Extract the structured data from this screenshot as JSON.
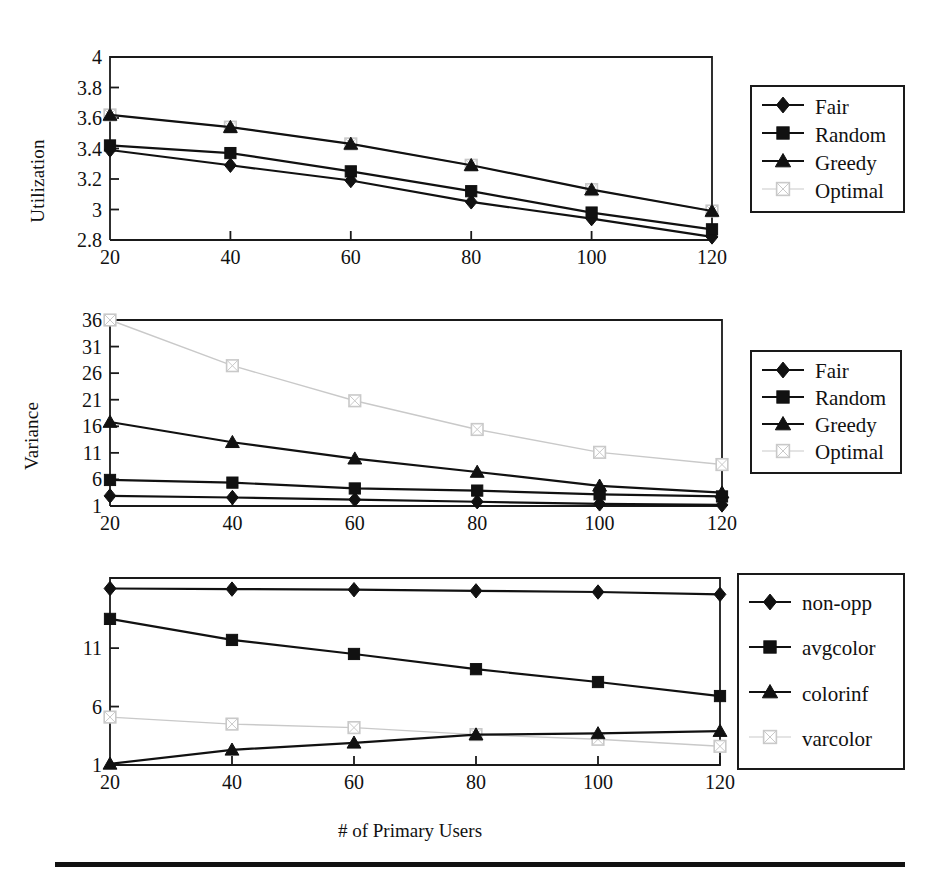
{
  "figure": {
    "xlabel": "# of Primary Users",
    "footer_rule": true
  },
  "chart_data": [
    {
      "id": "utilization",
      "type": "line",
      "title": "",
      "xlabel": "# of Primary Users",
      "ylabel": "Utilization",
      "x": [
        20,
        40,
        60,
        80,
        100,
        120
      ],
      "xticks": [
        "20",
        "40",
        "60",
        "80",
        "100",
        "120"
      ],
      "xlim": [
        20,
        120
      ],
      "ylim": [
        2.8,
        4
      ],
      "yticks": [
        "2.8",
        "3",
        "3.2",
        "3.4",
        "3.6",
        "3.8",
        "4"
      ],
      "ytickvals": [
        2.8,
        3,
        3.2,
        3.4,
        3.6,
        3.8,
        4
      ],
      "grid": false,
      "legend_position": "right-outside",
      "series": [
        {
          "name": "Fair",
          "marker": "diamond",
          "color": "#111111",
          "values": [
            3.39,
            3.29,
            3.19,
            3.05,
            2.94,
            2.82
          ]
        },
        {
          "name": "Random",
          "marker": "square",
          "color": "#111111",
          "values": [
            3.42,
            3.37,
            3.25,
            3.12,
            2.98,
            2.87
          ]
        },
        {
          "name": "Greedy",
          "marker": "triangle",
          "color": "#111111",
          "values": [
            3.62,
            3.54,
            3.43,
            3.29,
            3.13,
            2.99
          ]
        },
        {
          "name": "Optimal",
          "marker": "square-open",
          "color": "#c9c9c9",
          "values": [
            3.62,
            3.54,
            3.43,
            3.29,
            3.13,
            2.99
          ]
        }
      ]
    },
    {
      "id": "variance",
      "type": "line",
      "title": "",
      "xlabel": "# of Primary Users",
      "ylabel": "Variance",
      "x": [
        20,
        40,
        60,
        80,
        100,
        120
      ],
      "xticks": [
        "20",
        "40",
        "60",
        "80",
        "100",
        "120"
      ],
      "xlim": [
        20,
        120
      ],
      "ylim": [
        1,
        36
      ],
      "yticks": [
        "1",
        "6",
        "11",
        "16",
        "21",
        "26",
        "31",
        "36"
      ],
      "ytickvals": [
        1,
        6,
        11,
        16,
        21,
        26,
        31,
        36
      ],
      "grid": false,
      "legend_position": "right-outside",
      "series": [
        {
          "name": "Fair",
          "marker": "diamond",
          "color": "#111111",
          "values": [
            2.9,
            2.6,
            2.2,
            1.8,
            1.4,
            1.2
          ]
        },
        {
          "name": "Random",
          "marker": "square",
          "color": "#111111",
          "values": [
            5.9,
            5.4,
            4.3,
            3.9,
            3.2,
            2.8
          ]
        },
        {
          "name": "Greedy",
          "marker": "triangle",
          "color": "#111111",
          "values": [
            16.8,
            13.0,
            9.9,
            7.4,
            4.8,
            3.5
          ]
        },
        {
          "name": "Optimal",
          "marker": "square-open",
          "color": "#c9c9c9",
          "values": [
            36.0,
            27.4,
            20.8,
            15.4,
            11.1,
            8.8
          ]
        }
      ]
    },
    {
      "id": "coloring",
      "type": "line",
      "title": "",
      "xlabel": "# of Primary Users",
      "ylabel": "",
      "x": [
        20,
        40,
        60,
        80,
        100,
        120
      ],
      "xticks": [
        "20",
        "40",
        "60",
        "80",
        "100",
        "120"
      ],
      "xlim": [
        20,
        120
      ],
      "ylim": [
        1,
        17
      ],
      "yticks": [
        "1",
        "6",
        "11"
      ],
      "ytickvals": [
        1,
        6,
        11
      ],
      "grid": false,
      "legend_position": "right-outside",
      "series": [
        {
          "name": "non-opp",
          "marker": "diamond",
          "color": "#111111",
          "values": [
            16.1,
            16.05,
            16.0,
            15.9,
            15.8,
            15.6
          ]
        },
        {
          "name": "avgcolor",
          "marker": "square",
          "color": "#111111",
          "values": [
            13.5,
            11.7,
            10.5,
            9.2,
            8.1,
            6.9
          ]
        },
        {
          "name": "colorinf",
          "marker": "triangle",
          "color": "#111111",
          "values": [
            1.1,
            2.3,
            2.9,
            3.6,
            3.7,
            3.9
          ]
        },
        {
          "name": "varcolor",
          "marker": "square-open",
          "color": "#c9c9c9",
          "values": [
            5.1,
            4.5,
            4.2,
            3.6,
            3.2,
            2.6
          ]
        }
      ]
    }
  ],
  "legends": [
    {
      "id": "legend-utilization",
      "items": [
        {
          "label": "Fair",
          "marker": "diamond",
          "color": "#111111"
        },
        {
          "label": "Random",
          "marker": "square",
          "color": "#111111"
        },
        {
          "label": "Greedy",
          "marker": "triangle",
          "color": "#111111"
        },
        {
          "label": "Optimal",
          "marker": "square-open",
          "color": "#c9c9c9"
        }
      ]
    },
    {
      "id": "legend-variance",
      "items": [
        {
          "label": "Fair",
          "marker": "diamond",
          "color": "#111111"
        },
        {
          "label": "Random",
          "marker": "square",
          "color": "#111111"
        },
        {
          "label": "Greedy",
          "marker": "triangle",
          "color": "#111111"
        },
        {
          "label": "Optimal",
          "marker": "square-open",
          "color": "#c9c9c9"
        }
      ]
    },
    {
      "id": "legend-coloring",
      "items": [
        {
          "label": "non-opp",
          "marker": "diamond",
          "color": "#111111"
        },
        {
          "label": "avgcolor",
          "marker": "square",
          "color": "#111111"
        },
        {
          "label": "colorinf",
          "marker": "triangle",
          "color": "#111111"
        },
        {
          "label": "varcolor",
          "marker": "square-open",
          "color": "#c9c9c9"
        }
      ]
    }
  ]
}
